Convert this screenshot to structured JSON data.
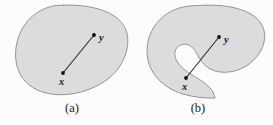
{
  "figure": {
    "kind": "mathematical-diagram",
    "background_color": "#fcfcfc",
    "shape_fill_color": "#dcdcdc",
    "shape_stroke_color": "#8a8a8a",
    "segment_color": "#2b2b2b",
    "point_color": "#111111",
    "label_color": "#1a1a1a"
  },
  "panels": [
    {
      "id": "panel-a",
      "caption": "(a)",
      "caption_x": 72,
      "caption_y": 112,
      "shape_name": "convex-blob",
      "shape_path": "M 63.5 5.2 C 80 4.4 96 7.0 108 12.5 C 119 17.6 126.5 26.0 127.6 36.5 C 128.8 48.0 125.0 59.5 118.0 68.8 C 110.5 78.8 99.0 86.0 86.0 90.5 C 72.0 95.3 56.0 96.3 42.5 92.0 C 30.0 88.0 20.8 79.0 17.4 67.5 C 14.0 56.0 15.4 43.0 20.6 31.8 C 26.2 19.8 36.5 10.8 49.5 6.9 C 54.0 5.6 58.7 5.0 63.5 5.2 Z",
      "points": [
        {
          "name": "x",
          "label": "x",
          "cx": 63,
          "cy": 73,
          "label_x": 59,
          "label_y": 85
        },
        {
          "name": "y",
          "label": "y",
          "cx": 94,
          "cy": 35,
          "label_x": 99,
          "label_y": 41
        }
      ],
      "segment": {
        "x1": 63,
        "y1": 73,
        "x2": 94,
        "y2": 35
      },
      "segment_inside": true
    },
    {
      "id": "panel-b",
      "caption": "(b)",
      "caption_x": 198,
      "caption_y": 112,
      "shape_name": "nonconvex-kidney",
      "shape_path": "M 206.0 5.2 C 222.0 4.6 238.5 7.2 250.5 13.8 C 260.5 19.4 265.6 28.4 264.6 38.5 C 263.6 49.2 257.0 58.6 248.0 64.8 C 239.0 71.0 227.8 73.6 217.5 71.6 C 210.2 70.2 204.5 66.0 200.6 60.0 C 197.2 54.8 195.0 48.6 190.0 45.6 C 185.5 42.9 179.6 44.0 176.6 48.2 C 173.8 52.2 174.6 57.6 177.2 61.8 C 180.0 66.4 184.4 69.8 188.8 72.8 C 196.0 77.6 204.0 81.4 209.8 87.8 C 212.6 90.9 214.6 94.6 215.0 98.0 C 205.0 98.4 194.0 97.2 183.5 94.2 C 170.5 90.4 159.4 82.8 152.8 72.0 C 146.4 61.4 145.4 48.4 149.4 36.4 C 153.6 23.8 163.6 13.8 176.6 8.9 C 185.8 5.4 196.0 5.6 206.0 5.2 Z",
      "points": [
        {
          "name": "x",
          "label": "x",
          "cx": 186,
          "cy": 78,
          "label_x": 182,
          "label_y": 90
        },
        {
          "name": "y",
          "label": "y",
          "cx": 219,
          "cy": 37,
          "label_x": 224,
          "label_y": 43
        }
      ],
      "segment": {
        "x1": 186,
        "y1": 78,
        "x2": 219,
        "y2": 37
      },
      "segment_inside": false
    }
  ]
}
